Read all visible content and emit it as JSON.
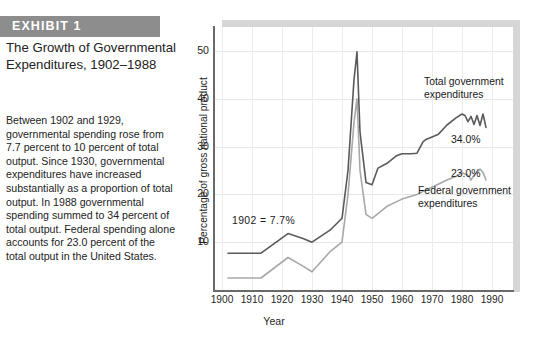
{
  "exhibit": {
    "badge": "EXHIBIT  1",
    "title": "The Growth of Governmental Expenditures, 1902–1988",
    "body": "Between 1902 and 1929, governmental spending rose from 7.7 percent to 10 percent of total output. Since 1930, governmental expenditures have increased substantially as a proportion of total output. In 1988 governmental spending summed to 34 percent of total output. Federal spending alone accounts for 23.0 percent of the total output in the United States.",
    "badge_bg": "#8d8d8d",
    "badge_fg": "#ffffff"
  },
  "annotations": {
    "start_value": "1902  =  7.7%",
    "total_label": "Total government expenditures",
    "total_value": "34.0%",
    "federal_label": "Federal government expenditures",
    "federal_value": "23.0%"
  },
  "chart_data": {
    "type": "line",
    "title": "",
    "xlabel": "Year",
    "ylabel": "Percentage of gross national product",
    "xlim": [
      1897,
      1997
    ],
    "ylim": [
      0,
      55
    ],
    "yticks": [
      10,
      20,
      30,
      40,
      50
    ],
    "xticks": [
      1900,
      1910,
      1920,
      1930,
      1940,
      1950,
      1960,
      1970,
      1980,
      1990
    ],
    "grid": true,
    "legend_position": "inline-annotations",
    "colors": {
      "total": "#5a5a5a",
      "federal": "#a8a8a8",
      "axis": "#6a6a6a",
      "grid": "#e6e6e6",
      "shadow": "#d6d6d6"
    },
    "series": [
      {
        "name": "Total government expenditures",
        "color": "#5a5a5a",
        "x": [
          1902,
          1913,
          1922,
          1927,
          1930,
          1936,
          1940,
          1942,
          1944,
          1945,
          1946,
          1948,
          1950,
          1952,
          1955,
          1958,
          1960,
          1963,
          1965,
          1967,
          1968,
          1970,
          1972,
          1975,
          1978,
          1980,
          1981,
          1982,
          1983,
          1984,
          1985,
          1986,
          1987,
          1988
        ],
        "y": [
          7.7,
          7.7,
          11.8,
          10.8,
          10.0,
          12.5,
          15.0,
          25.0,
          44.0,
          49.8,
          33.0,
          22.5,
          22.0,
          25.5,
          26.5,
          28.0,
          28.5,
          28.5,
          28.6,
          31.0,
          31.5,
          32.0,
          32.5,
          34.5,
          36.0,
          36.8,
          36.5,
          35.2,
          36.3,
          34.6,
          36.5,
          34.4,
          36.8,
          34.0
        ]
      },
      {
        "name": "Federal government expenditures",
        "color": "#a8a8a8",
        "x": [
          1902,
          1913,
          1922,
          1927,
          1930,
          1936,
          1940,
          1942,
          1944,
          1945,
          1946,
          1948,
          1950,
          1955,
          1960,
          1965,
          1970,
          1975,
          1978,
          1980,
          1982,
          1983,
          1984,
          1985,
          1986,
          1987,
          1988
        ],
        "y": [
          2.5,
          2.5,
          6.8,
          5.0,
          3.8,
          8.0,
          10.0,
          20.0,
          35.0,
          40.0,
          25.0,
          15.8,
          15.0,
          17.5,
          19.0,
          20.0,
          21.5,
          23.0,
          23.8,
          24.5,
          24.0,
          23.0,
          24.0,
          24.5,
          25.3,
          24.6,
          23.0
        ]
      }
    ]
  }
}
